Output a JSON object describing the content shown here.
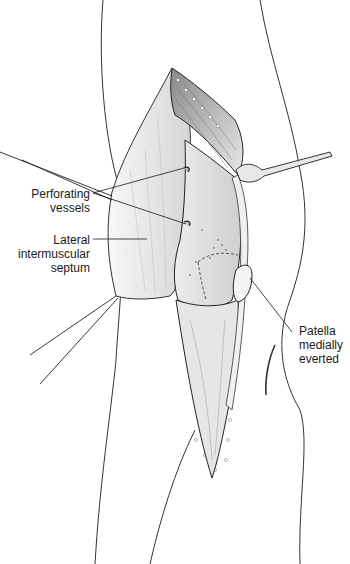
{
  "figure": {
    "labels": [
      {
        "id": "perforating-vessels",
        "lines": [
          "Perforating",
          "vessels"
        ]
      },
      {
        "id": "lateral-intermuscular-septum",
        "lines": [
          "Lateral",
          "intermuscular",
          "septum"
        ]
      },
      {
        "id": "patella-medially-everted",
        "lines": [
          "Patella",
          "medially",
          "everted"
        ]
      }
    ],
    "colors": {
      "line": "#1a1a1a",
      "tissue_light": "#f2f2f2",
      "tissue_mid": "#d9d9d9",
      "tissue_dark": "#9a9a9a",
      "background": "#ffffff"
    }
  }
}
